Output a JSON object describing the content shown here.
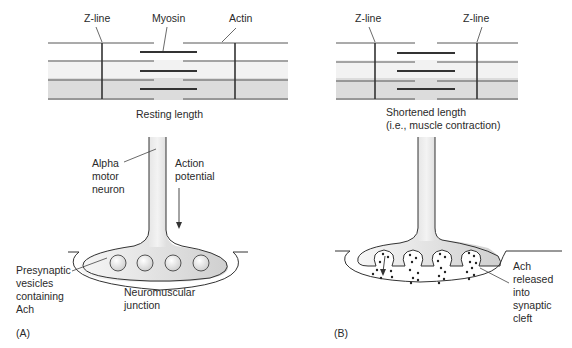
{
  "panelA": {
    "tag": "(A)",
    "labels": {
      "zline": "Z-line",
      "myosin": "Myosin",
      "actin": "Actin",
      "resting": "Resting length",
      "alpha": [
        "Alpha",
        "motor",
        "neuron"
      ],
      "action": [
        "Action",
        "potential"
      ],
      "presynaptic": [
        "Presynaptic",
        "vesicles",
        "containing",
        "Ach"
      ],
      "nmj": [
        "Neuromuscular",
        "junction"
      ]
    }
  },
  "panelB": {
    "tag": "(B)",
    "labels": {
      "zline_left": "Z-line",
      "zline_right": "Z-line",
      "shortened": [
        "Shortened length",
        "(i.e., muscle contraction)"
      ],
      "ach": [
        "Ach",
        "released",
        "into",
        "synaptic",
        "cleft"
      ]
    }
  },
  "colors": {
    "line": "#333333",
    "fill_light": "#f2f2f2",
    "fill_dark": "#d4d4d4"
  }
}
